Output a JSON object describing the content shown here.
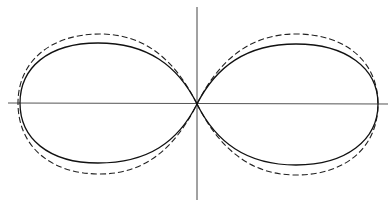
{
  "diagram": {
    "type": "polar-figure-eight",
    "axes": {
      "horizontal": {
        "x1": 8,
        "x2": 388,
        "y": 103
      },
      "vertical": {
        "x": 197,
        "y1": 7,
        "y2": 200
      },
      "color": "#555555"
    },
    "curves": [
      {
        "name": "solid-pattern",
        "style": "solid",
        "color": "#111111"
      },
      {
        "name": "dashed-pattern",
        "style": "dashed",
        "color": "#222222"
      }
    ],
    "labels": []
  }
}
